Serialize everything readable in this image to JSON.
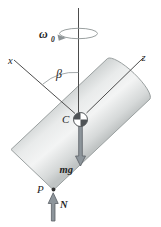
{
  "figure": {
    "labels": {
      "omega": "ω",
      "omega_sub": "0",
      "x_axis": "x",
      "z_axis": "z",
      "beta": "β",
      "center": "C",
      "weight": "mg",
      "contact_point": "P",
      "normal_force": "N"
    },
    "colors": {
      "axis_line": "#4d4d4d",
      "rotation_arrow": "#9aa0a0",
      "arrow_fill": "#8d959b",
      "arrow_stroke": "#5a6066",
      "cylinder_stroke": "#9aa0a0",
      "com_dark": "#4f5356",
      "point_dot": "#333333",
      "background": "#ffffff",
      "text": "#1f1f1f"
    }
  }
}
